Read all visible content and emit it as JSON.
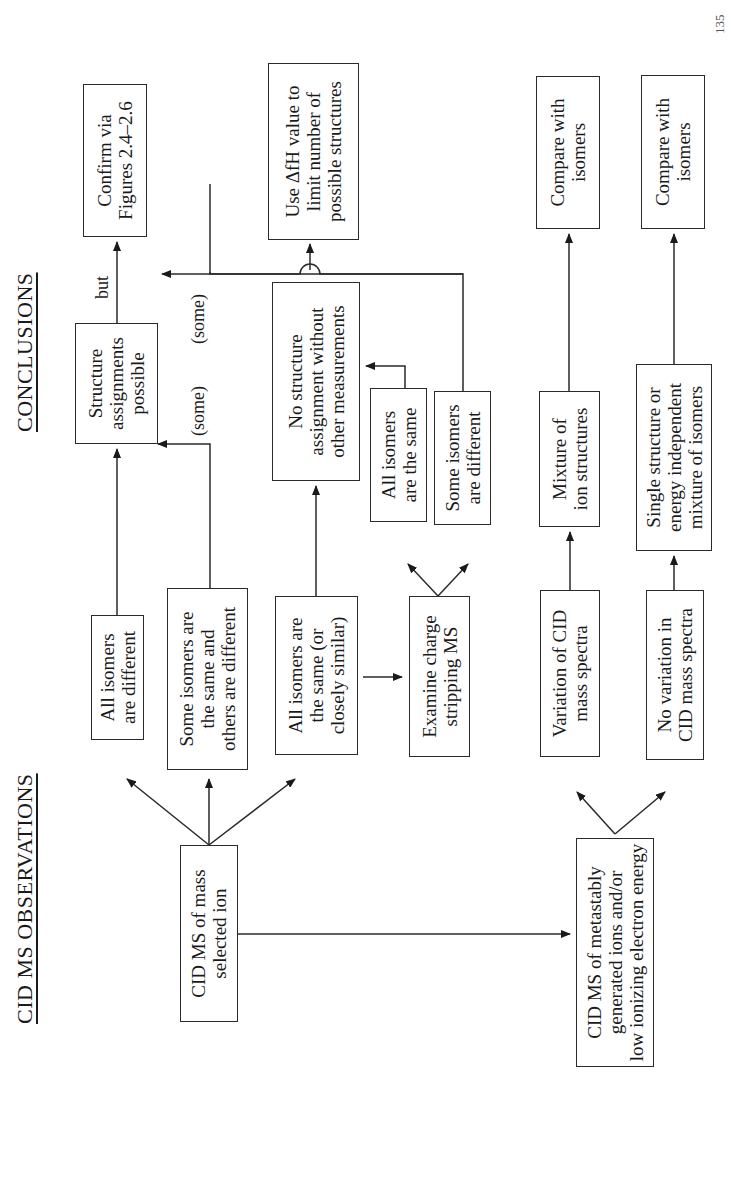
{
  "headings": {
    "observations": "CID MS OBSERVATIONS",
    "conclusions": "CONCLUSIONS"
  },
  "boxes": {
    "cid_mass_selected": "CID MS of mass\nselected ion",
    "cid_metastable": "CID MS of metastably\ngenerated ions and/or\nlow ionizing electron energy",
    "all_different": "All isomers\nare different",
    "some_same_some_different": "Some isomers are\nthe same and\nothers are different",
    "all_same_closely_similar": "All isomers are\nthe same (or\nclosely similar)",
    "examine_charge_stripping": "Examine charge\nstripping MS",
    "variation_cid": "Variation of CID\nmass spectra",
    "no_variation_cid": "No variation in\nCID mass spectra",
    "structure_assignments_possible": "Structure\nassignments\npossible",
    "no_structure_assignment": "No structure\nassignment without\nother measurements",
    "cs_all_same": "All isomers\nare the same",
    "cs_some_different": "Some isomers\nare different",
    "mixture_ion_structures": "Mixture of\nion structures",
    "single_structure": "Single structure or\nenergy independent\nmixture of isomers",
    "confirm_via_figures": "Confirm via\nFigures 2.4–2.6",
    "use_delta_h": "Use ΔfH value to\nlimit number of\npossible structures",
    "compare_isomers_1": "Compare with\nisomers",
    "compare_isomers_2": "Compare with\nisomers"
  },
  "labels": {
    "but": "but",
    "some_1": "(some)",
    "some_2": "(some)"
  },
  "page_number": "135"
}
